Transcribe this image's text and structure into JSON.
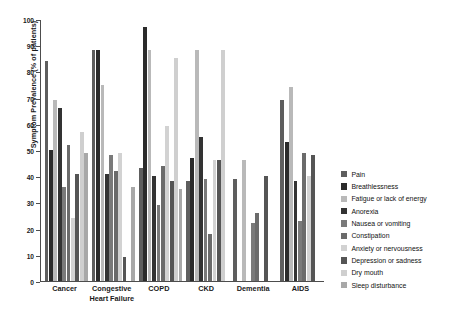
{
  "chart_data": {
    "type": "bar",
    "title": "",
    "xlabel": "",
    "ylabel": "Symptom Prevalence (% of patients)",
    "ylim": [
      0,
      100
    ],
    "ytick_labels": [
      "0",
      "10",
      "20",
      "30",
      "40",
      "50",
      "60",
      "70",
      "80",
      "90",
      "100"
    ],
    "ytick_values": [
      0,
      10,
      20,
      30,
      40,
      50,
      60,
      70,
      80,
      90,
      100
    ],
    "grid": false,
    "legend_position": "right",
    "categories": [
      "Cancer",
      "Congestive Heart Failure",
      "COPD",
      "CKD",
      "Dementia",
      "AIDS"
    ],
    "category_display": [
      [
        "Cancer"
      ],
      [
        "Congestive",
        "Heart Failure"
      ],
      [
        "COPD"
      ],
      [
        "CKD"
      ],
      [
        "Dementia"
      ],
      [
        "AIDS"
      ]
    ],
    "series": [
      {
        "name": "Pain",
        "color": "#5e5e5e",
        "values": [
          84,
          88,
          43,
          38,
          39,
          69
        ]
      },
      {
        "name": "Breathlessness",
        "color": "#2b2b2b",
        "values": [
          50,
          88,
          97,
          47,
          null,
          53
        ]
      },
      {
        "name": "Fatigue or lack of energy",
        "color": "#b9b9b9",
        "values": [
          69,
          75,
          88,
          88,
          46,
          74
        ]
      },
      {
        "name": "Anorexia",
        "color": "#333333",
        "values": [
          66,
          41,
          40,
          55,
          null,
          38
        ]
      },
      {
        "name": "Nausea or vomiting",
        "color": "#7a7a7a",
        "values": [
          36,
          48,
          29,
          39,
          22,
          23
        ]
      },
      {
        "name": "Constipation",
        "color": "#6b6b6b",
        "values": [
          52,
          42,
          44,
          18,
          26,
          49
        ]
      },
      {
        "name": "Anxiety or nervousness",
        "color": "#d2d2d2",
        "values": [
          24,
          49,
          59,
          46,
          null,
          40
        ]
      },
      {
        "name": "Depression or sadness",
        "color": "#555555",
        "values": [
          41,
          9,
          38,
          46,
          40,
          48
        ]
      },
      {
        "name": "Dry mouth",
        "color": "#cfcfcf",
        "values": [
          57,
          null,
          85,
          88,
          null,
          null
        ]
      },
      {
        "name": "Sleep disturbance",
        "color": "#a8a8a8",
        "values": [
          49,
          36,
          35,
          null,
          null,
          null
        ]
      }
    ]
  },
  "legend": {
    "items": [
      "Pain",
      "Breathlessness",
      "Fatigue or lack of energy",
      "Anorexia",
      "Nausea or vomiting",
      "Constipation",
      "Anxiety or nervousness",
      "Depression or sadness",
      "Dry mouth",
      "Sleep disturbance"
    ]
  }
}
